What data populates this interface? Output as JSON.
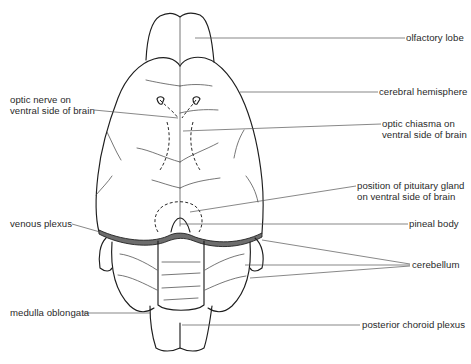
{
  "figure": {
    "labels_left": [
      {
        "id": "optic-nerve",
        "lines": [
          "optic nerve on",
          "ventral side of brain"
        ]
      },
      {
        "id": "venous-plexus",
        "lines": [
          "venous plexus"
        ]
      },
      {
        "id": "medulla-oblongata",
        "lines": [
          "medulla oblongata"
        ]
      }
    ],
    "labels_right": [
      {
        "id": "olfactory-lobe",
        "lines": [
          "olfactory lobe"
        ]
      },
      {
        "id": "cerebral-hemisphere",
        "lines": [
          "cerebral hemisphere"
        ]
      },
      {
        "id": "optic-chiasma",
        "lines": [
          "optic chiasma on",
          "ventral side of brain"
        ]
      },
      {
        "id": "pituitary-gland",
        "lines": [
          "position of pituitary gland",
          "on ventral side of brain"
        ]
      },
      {
        "id": "pineal-body",
        "lines": [
          "pineal body"
        ]
      },
      {
        "id": "cerebellum",
        "lines": [
          "cerebellum"
        ]
      },
      {
        "id": "posterior-choroid-plexus",
        "lines": [
          "posterior choroid plexus"
        ]
      }
    ]
  },
  "colors": {
    "outline": "#1e1e1e",
    "leader": "#555555",
    "venous_band": "#6d6d6d",
    "text": "#2a2a2a",
    "background": "#ffffff"
  }
}
